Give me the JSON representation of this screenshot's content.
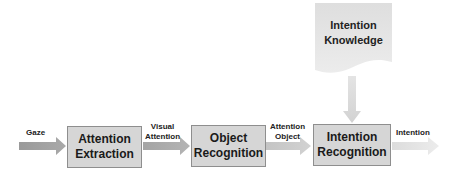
{
  "diagram": {
    "type": "flowchart",
    "direction": "left-to-right",
    "colors": {
      "box_fill": "#d6d6d6",
      "box_border": "#8e8e8e",
      "arrow_dark": "#9a9a9a",
      "arrow_light": "#e4e4e4",
      "document_fill": "#e6e6e6",
      "text": "#1a1a1a"
    },
    "nodes": [
      {
        "id": "attention-extraction",
        "shape": "rectangle",
        "line1": "Attention",
        "line2": "Extraction"
      },
      {
        "id": "object-recognition",
        "shape": "rectangle",
        "line1": "Object",
        "line2": "Recognition"
      },
      {
        "id": "intention-recognition",
        "shape": "rectangle",
        "line1": "Intention",
        "line2": "Recognition"
      },
      {
        "id": "intention-knowledge",
        "shape": "document",
        "line1": "Intention",
        "line2": "Knowledge"
      }
    ],
    "edges": [
      {
        "from": "input",
        "to": "attention-extraction",
        "label_line1": "Gaze",
        "label_line2": ""
      },
      {
        "from": "attention-extraction",
        "to": "object-recognition",
        "label_line1": "Visual",
        "label_line2": "Attention"
      },
      {
        "from": "object-recognition",
        "to": "intention-recognition",
        "label_line1": "Attention",
        "label_line2": "Object"
      },
      {
        "from": "intention-knowledge",
        "to": "intention-recognition",
        "label_line1": "",
        "label_line2": ""
      },
      {
        "from": "intention-recognition",
        "to": "output",
        "label_line1": "Intention",
        "label_line2": ""
      }
    ]
  }
}
